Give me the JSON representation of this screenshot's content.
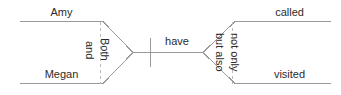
{
  "diagram": {
    "type": "sentence-coordination-diagram",
    "stroke_color": "#9a9a9a",
    "text_color": "#2b2b2b",
    "left_branch": {
      "top_label": "Amy",
      "bottom_label": "Megan",
      "inner_connector": "and",
      "outer_connector": "Both"
    },
    "middle": {
      "predicate": "have"
    },
    "right_branch": {
      "top_label": "called",
      "bottom_label": "visited",
      "inner_connector": "but also",
      "outer_connector": "not only"
    }
  }
}
